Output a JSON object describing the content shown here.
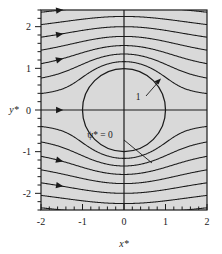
{
  "figure": {
    "background_color": "#ffffff",
    "plot_fill_color": "#d9d9d9",
    "line_color": "#1a1a1a",
    "frame_color": "#1a1a1a"
  },
  "axes": {
    "x": {
      "label": "x*",
      "tick_labels": [
        "-2",
        "-1",
        "0",
        "1",
        "2"
      ],
      "tick_values": [
        -2,
        -1,
        0,
        1,
        2
      ],
      "minor_ticks_per_interval": 5,
      "range": [
        -2,
        2
      ]
    },
    "y": {
      "label": "y*",
      "tick_labels": [
        "2",
        "1",
        "0",
        "-1",
        "-2"
      ],
      "tick_values": [
        2,
        1,
        0,
        -1,
        -2
      ],
      "minor_ticks_per_interval": 5,
      "range": [
        -2.4,
        2.4
      ]
    }
  },
  "annotations": [
    {
      "name": "cylinder-radius-label",
      "text": "1",
      "x": 0.55,
      "y": 0.38
    },
    {
      "name": "stagnation-streamline-label",
      "text": "ψ* = 0",
      "x": -0.17,
      "y": -0.35
    }
  ],
  "chart_data": {
    "type": "line",
    "title": "",
    "xlabel": "x*",
    "ylabel": "y*",
    "xlim": [
      -2,
      2
    ],
    "ylim": [
      -2.4,
      2.4
    ],
    "grid": false,
    "legend": null,
    "cylinder": {
      "center": [
        0,
        0
      ],
      "radius": 1,
      "label": "1"
    },
    "stagnation_streamline": {
      "value": 0,
      "label": "ψ* = 0"
    },
    "series": [
      {
        "name": "ψ* = 0",
        "value": 0.0
      },
      {
        "name": "ψ* = 0.3",
        "value": 0.3
      },
      {
        "name": "ψ* = 0.6",
        "value": 0.6
      },
      {
        "name": "ψ* = 0.9",
        "value": 0.9
      },
      {
        "name": "ψ* = 1.2",
        "value": 1.2
      },
      {
        "name": "ψ* = 1.5",
        "value": 1.5
      },
      {
        "name": "ψ* = 1.8",
        "value": 1.8
      },
      {
        "name": "ψ* = 2.1",
        "value": 2.1
      },
      {
        "name": "ψ* = -0.3",
        "value": -0.3
      },
      {
        "name": "ψ* = -0.6",
        "value": -0.6
      },
      {
        "name": "ψ* = -0.9",
        "value": -0.9
      },
      {
        "name": "ψ* = -1.2",
        "value": -1.2
      },
      {
        "name": "ψ* = -1.5",
        "value": -1.5
      },
      {
        "name": "ψ* = -1.8",
        "value": -1.8
      },
      {
        "name": "ψ* = -2.1",
        "value": -2.1
      }
    ],
    "flow_direction_arrows": {
      "count": 6,
      "direction": "right",
      "at_x": -1.55,
      "at_psi": [
        2.1,
        1.5,
        0.9,
        0.0,
        -0.9,
        -1.5
      ]
    }
  }
}
